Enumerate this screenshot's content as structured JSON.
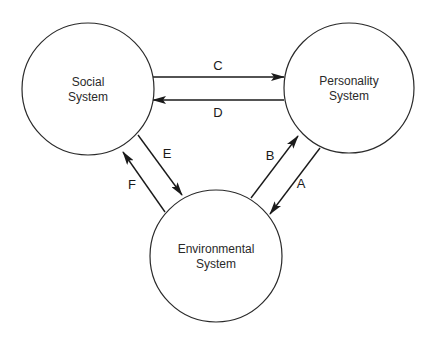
{
  "diagram": {
    "nodes": [
      {
        "id": "social",
        "line1": "Social",
        "line2": "System",
        "cx": 88,
        "cy": 89,
        "r": 66
      },
      {
        "id": "personality",
        "line1": "Personality",
        "line2": "System",
        "cx": 349,
        "cy": 88,
        "r": 65
      },
      {
        "id": "environmental",
        "line1": "Environmental",
        "line2": "System",
        "cx": 216,
        "cy": 256,
        "r": 66
      }
    ],
    "edges": [
      {
        "id": "C",
        "label": "C",
        "from": "social",
        "to": "personality",
        "x1": 152,
        "y1": 77,
        "x2": 284,
        "y2": 77,
        "lx": 218,
        "ly": 70
      },
      {
        "id": "D",
        "label": "D",
        "from": "personality",
        "to": "social",
        "x1": 284,
        "y1": 100,
        "x2": 153,
        "y2": 100,
        "lx": 218,
        "ly": 117
      },
      {
        "id": "E",
        "label": "E",
        "from": "social",
        "to": "environmental",
        "x1": 138,
        "y1": 135,
        "x2": 182,
        "y2": 195,
        "lx": 167,
        "ly": 158
      },
      {
        "id": "F",
        "label": "F",
        "from": "environmental",
        "to": "social",
        "x1": 165,
        "y1": 212,
        "x2": 123,
        "y2": 152,
        "lx": 132,
        "ly": 189
      },
      {
        "id": "B",
        "label": "B",
        "from": "environmental",
        "to": "personality",
        "x1": 251,
        "y1": 198,
        "x2": 298,
        "y2": 136,
        "lx": 270,
        "ly": 160
      },
      {
        "id": "A",
        "label": "A",
        "from": "personality",
        "to": "environmental",
        "x1": 320,
        "y1": 148,
        "x2": 270,
        "y2": 214,
        "lx": 301,
        "ly": 188
      }
    ],
    "colors": {
      "stroke": "#1a1a1a",
      "background": "#ffffff"
    }
  }
}
